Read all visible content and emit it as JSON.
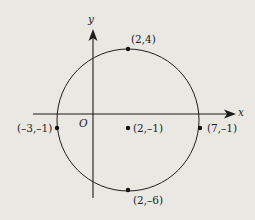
{
  "diagram": {
    "type": "circle-on-coordinate-plane",
    "axes": {
      "x_label": "x",
      "y_label": "y",
      "origin_label": "O"
    },
    "circle": {
      "center": {
        "label": "(2,–1)",
        "x": 2,
        "y": -1
      },
      "radius": 5
    },
    "points": [
      {
        "id": "top",
        "label": "(2,4)",
        "x": 2,
        "y": 4
      },
      {
        "id": "left",
        "label": "(–3,–1)",
        "x": -3,
        "y": -1
      },
      {
        "id": "center",
        "label": "(2,–1)",
        "x": 2,
        "y": -1
      },
      {
        "id": "right",
        "label": "(7,–1)",
        "x": 7,
        "y": -1
      },
      {
        "id": "bottom",
        "label": "(2,–6)",
        "x": 2,
        "y": -6
      }
    ],
    "colors": {
      "background": "#e9e8e3",
      "stroke": "#1d1d1d"
    }
  }
}
